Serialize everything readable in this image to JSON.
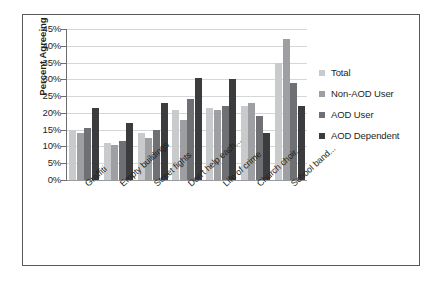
{
  "chart_data": {
    "type": "bar",
    "title": "",
    "xlabel": "",
    "ylabel": "Percent Agreeing",
    "ylim": [
      0,
      45
    ],
    "ytick_step": 5,
    "ytick_labels": [
      "45%",
      "40%",
      "35%",
      "30%",
      "25%",
      "20%",
      "15%",
      "10%",
      "5%",
      "0%"
    ],
    "grid": true,
    "legend_position": "right",
    "categories": [
      "Graffiti",
      "Empty buildings",
      "Street fights",
      "Don't help each...",
      "Life of crime",
      "Church choir...",
      "School band..."
    ],
    "series": [
      {
        "name": "Total",
        "color": "#c9cacb",
        "values": [
          15.0,
          11.0,
          14.0,
          21.0,
          21.5,
          22.0,
          35.0
        ]
      },
      {
        "name": "Non-AOD User",
        "color": "#9d9fa2",
        "values": [
          14.0,
          10.5,
          12.5,
          18.0,
          21.0,
          23.0,
          42.0
        ]
      },
      {
        "name": "AOD User",
        "color": "#6f7073",
        "values": [
          15.5,
          11.5,
          15.0,
          24.0,
          22.0,
          19.0,
          29.0
        ]
      },
      {
        "name": "AOD Dependent",
        "color": "#3b3c3e",
        "values": [
          21.5,
          17.0,
          23.0,
          30.5,
          30.0,
          14.0,
          22.0
        ]
      }
    ]
  },
  "figure": {
    "border_color": "#58595b",
    "background": "#ffffff",
    "gridline_color": "#d5d6d8",
    "axis_color": "#6d6e70"
  }
}
